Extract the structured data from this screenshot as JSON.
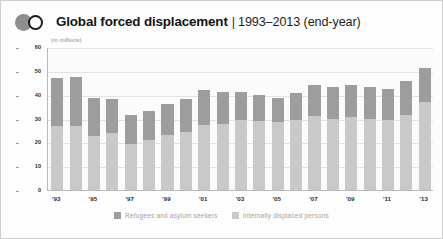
{
  "header": {
    "logo_disc": "filled-circle",
    "logo_ring": "ring-circle",
    "title_main": "Global forced displacement",
    "title_separator": "|",
    "title_sub": "1993–2013 (end-year)"
  },
  "chart_data": {
    "type": "bar",
    "stacked": true,
    "title": "Global forced displacement | 1993–2013 (end-year)",
    "xlabel": "",
    "ylabel": "",
    "units_note": "(in millions)",
    "ylim": [
      0,
      60
    ],
    "ytick_values": [
      0,
      10,
      20,
      30,
      40,
      50,
      60
    ],
    "ytick_labels": [
      "0",
      "10",
      "20",
      "30",
      "40",
      "50",
      "60"
    ],
    "grid": true,
    "legend_position": "bottom-center",
    "categories": [
      "1993",
      "1994",
      "1995",
      "1996",
      "1997",
      "1998",
      "1999",
      "2000",
      "2001",
      "2002",
      "2003",
      "2004",
      "2005",
      "2006",
      "2007",
      "2008",
      "2009",
      "2010",
      "2011",
      "2012",
      "2013"
    ],
    "xtick_labels": [
      "'93",
      "",
      "'95",
      "",
      "'97",
      "",
      "'99",
      "",
      "'01",
      "",
      "'03",
      "",
      "'05",
      "",
      "'07",
      "",
      "'09",
      "",
      "'11",
      "",
      "'13"
    ],
    "series": [
      {
        "name": "Refugees and asylum seekers",
        "color": "#9d9d9d",
        "values": [
          20.0,
          20.6,
          16.1,
          14.3,
          12.4,
          12.3,
          13.2,
          13.5,
          14.6,
          13.4,
          12.0,
          11.1,
          10.1,
          11.4,
          13.0,
          13.1,
          13.4,
          13.3,
          13.3,
          14.3,
          14.5
        ]
      },
      {
        "name": "Internally displaced persons",
        "color": "#c9c9c9",
        "values": [
          27.0,
          27.0,
          22.6,
          23.8,
          19.2,
          21.0,
          23.1,
          24.5,
          27.4,
          27.6,
          29.2,
          28.8,
          28.5,
          29.5,
          31.0,
          30.0,
          30.5,
          30.0,
          29.2,
          31.4,
          36.8
        ]
      }
    ],
    "totals": [
      47.0,
      47.6,
      38.7,
      38.1,
      31.6,
      33.3,
      36.3,
      38.0,
      42.0,
      41.0,
      41.2,
      39.9,
      38.6,
      40.9,
      44.0,
      43.1,
      43.9,
      43.3,
      42.5,
      45.7,
      51.3
    ],
    "legend": [
      {
        "label": "Refugees and asylum seekers",
        "color": "#9d9d9d"
      },
      {
        "label": "Internally displaced persons",
        "color": "#c9c9c9"
      }
    ]
  }
}
